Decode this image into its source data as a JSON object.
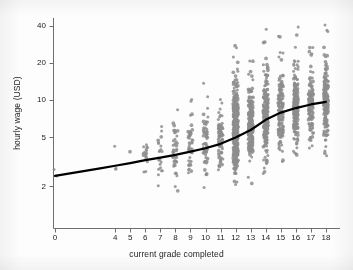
{
  "chart_data": {
    "type": "scatter",
    "title": "",
    "subtitle": "",
    "xlabel": "current grade completed",
    "ylabel": "hourly wage (USD)",
    "xscale": "linear",
    "yscale": "log",
    "xlim": [
      -0.9,
      18.9
    ],
    "ylim": [
      1.15,
      44
    ],
    "grid": false,
    "legend": null,
    "x_ticks": [
      0,
      4,
      5,
      6,
      7,
      8,
      9,
      10,
      11,
      12,
      13,
      14,
      15,
      16,
      17,
      18
    ],
    "x_tick_labels": [
      "0",
      "4",
      "5",
      "6",
      "7",
      "8",
      "9",
      "10",
      "11",
      "12",
      "13",
      "14",
      "15",
      "16",
      "17",
      "18"
    ],
    "y_ticks": [
      2,
      5,
      10,
      20,
      40
    ],
    "y_tick_labels": [
      "2",
      "5",
      "10",
      "20",
      "40"
    ],
    "marker": {
      "shape": "circle",
      "color": "#8d8d8d",
      "size_px": 3.0,
      "opacity": 0.85,
      "jitter_x": 0.16
    },
    "series": [
      {
        "name": "observations",
        "type": "scatter",
        "groups": [
          {
            "x": 0,
            "n": 2,
            "median": 2.6,
            "spread": 0.1,
            "ymin": 2.4,
            "ymax": 2.8
          },
          {
            "x": 4,
            "n": 3,
            "median": 3.1,
            "spread": 0.16,
            "ymin": 2.5,
            "ymax": 4.2
          },
          {
            "x": 5,
            "n": 1,
            "median": 3.8,
            "spread": 0.1,
            "ymin": 3.8,
            "ymax": 3.8
          },
          {
            "x": 6,
            "n": 16,
            "median": 3.6,
            "spread": 0.22,
            "ymin": 2.6,
            "ymax": 6.0
          },
          {
            "x": 7,
            "n": 22,
            "median": 3.5,
            "spread": 0.26,
            "ymin": 1.9,
            "ymax": 6.5
          },
          {
            "x": 8,
            "n": 40,
            "median": 3.9,
            "spread": 0.3,
            "ymin": 1.5,
            "ymax": 27.0
          },
          {
            "x": 9,
            "n": 46,
            "median": 4.3,
            "spread": 0.3,
            "ymin": 1.6,
            "ymax": 40.0
          },
          {
            "x": 10,
            "n": 60,
            "median": 4.5,
            "spread": 0.31,
            "ymin": 1.3,
            "ymax": 14.0
          },
          {
            "x": 11,
            "n": 78,
            "median": 4.9,
            "spread": 0.31,
            "ymin": 1.7,
            "ymax": 40.0
          },
          {
            "x": 12,
            "n": 420,
            "median": 5.6,
            "spread": 0.36,
            "ymin": 1.4,
            "ymax": 40.0
          },
          {
            "x": 13,
            "n": 210,
            "median": 6.3,
            "spread": 0.36,
            "ymin": 1.7,
            "ymax": 40.0
          },
          {
            "x": 14,
            "n": 225,
            "median": 7.3,
            "spread": 0.36,
            "ymin": 2.1,
            "ymax": 40.0
          },
          {
            "x": 15,
            "n": 140,
            "median": 8.1,
            "spread": 0.37,
            "ymin": 1.8,
            "ymax": 40.0
          },
          {
            "x": 16,
            "n": 205,
            "median": 8.8,
            "spread": 0.38,
            "ymin": 1.9,
            "ymax": 40.0
          },
          {
            "x": 17,
            "n": 120,
            "median": 9.2,
            "spread": 0.36,
            "ymin": 2.4,
            "ymax": 34.0
          },
          {
            "x": 18,
            "n": 185,
            "median": 9.6,
            "spread": 0.38,
            "ymin": 1.4,
            "ymax": 40.0
          }
        ]
      },
      {
        "name": "lowess fit",
        "type": "line",
        "color": "#000000",
        "width_px": 2.2,
        "x": [
          0,
          1,
          2,
          3,
          4,
          5,
          6,
          7,
          8,
          9,
          10,
          11,
          12,
          13,
          14,
          15,
          16,
          17,
          18
        ],
        "y": [
          2.42,
          2.53,
          2.65,
          2.78,
          2.92,
          3.07,
          3.24,
          3.4,
          3.58,
          3.8,
          4.05,
          4.4,
          4.95,
          5.7,
          6.9,
          7.9,
          8.6,
          9.2,
          9.65
        ]
      }
    ]
  },
  "axes": {
    "x_title": "current grade completed",
    "y_title": "hourly wage (USD)",
    "axis_color": "#6e6e6e"
  },
  "geometry": {
    "plot_left": 53,
    "plot_right": 340,
    "plot_top": 18,
    "plot_bottom": 228,
    "x0_px": 55,
    "x_px_per_unit": 15.05,
    "y_ref_value": 10,
    "y_ref_px": 100,
    "y_px_per_decade": 123.0
  }
}
